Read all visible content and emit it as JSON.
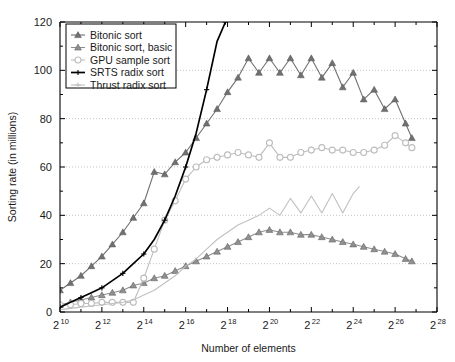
{
  "chart_data": {
    "type": "line",
    "title": "",
    "xlabel": "Number of elements",
    "ylabel": "Sorting rate (in millions)",
    "xlim": [
      10,
      28
    ],
    "ylim": [
      0,
      120
    ],
    "x_tick_labels": [
      "2^10",
      "2^12",
      "2^14",
      "2^16",
      "2^18",
      "2^20",
      "2^22",
      "2^24",
      "2^26",
      "2^28"
    ],
    "x_tick_base": "2",
    "x_tick_exponents": [
      "10",
      "12",
      "14",
      "16",
      "18",
      "20",
      "22",
      "24",
      "26",
      "28"
    ],
    "y_tick_labels": [
      "0",
      "20",
      "40",
      "60",
      "80",
      "100",
      "120"
    ],
    "y_ticks": [
      0,
      20,
      40,
      60,
      80,
      100,
      120
    ],
    "grid": "horizontal-dotted",
    "legend_position": "top-left",
    "series": [
      {
        "name": "Bitonic sort",
        "color": "#707070",
        "marker": "triangle-filled",
        "x": [
          10,
          10.5,
          11,
          11.5,
          12,
          12.5,
          13,
          13.5,
          14,
          14.5,
          15,
          15.5,
          16,
          16.5,
          17,
          17.5,
          18,
          18.5,
          19,
          19.5,
          20,
          20.5,
          21,
          21.5,
          22,
          22.5,
          23,
          23.5,
          24,
          24.5,
          25,
          25.5,
          26,
          26.5,
          26.8
        ],
        "y": [
          9,
          12,
          15,
          19,
          23,
          28,
          33,
          39,
          45,
          58,
          57,
          62,
          66,
          72,
          78,
          84,
          91,
          97,
          105,
          99,
          105,
          99,
          105,
          98,
          105,
          97,
          103,
          93,
          99,
          88,
          92,
          84,
          88,
          78,
          72
        ]
      },
      {
        "name": "Bitonic sort, basic",
        "color": "#909090",
        "marker": "triangle-filled",
        "x": [
          10,
          10.5,
          11,
          11.5,
          12,
          12.5,
          13,
          13.5,
          14,
          14.5,
          15,
          15.5,
          16,
          16.5,
          17,
          17.5,
          18,
          18.5,
          19,
          19.5,
          20,
          20.5,
          21,
          21.5,
          22,
          22.5,
          23,
          23.5,
          24,
          24.5,
          25,
          25.5,
          26,
          26.5,
          26.8
        ],
        "y": [
          3,
          4,
          5,
          6,
          7,
          8,
          9,
          11,
          12,
          14,
          15,
          17,
          19,
          21,
          23,
          25,
          27,
          29,
          31,
          33,
          34,
          33,
          33,
          32,
          32,
          31,
          30,
          29,
          28,
          27,
          26,
          25,
          24,
          22,
          21
        ]
      },
      {
        "name": "GPU sample sort",
        "color": "#bdbdbd",
        "marker": "circle-open",
        "x": [
          10,
          10.5,
          11,
          11.5,
          12,
          12.5,
          13,
          13.5,
          14,
          14.5,
          15,
          15.5,
          16,
          16.5,
          17,
          17.5,
          18,
          18.5,
          19,
          19.5,
          20,
          20.5,
          21,
          21.5,
          22,
          22.5,
          23,
          23.5,
          24,
          24.5,
          25,
          25.5,
          26,
          26.5,
          26.8
        ],
        "y": [
          3,
          3,
          3.5,
          3.5,
          4,
          4,
          4,
          4,
          14,
          26,
          38,
          46,
          55,
          60,
          63,
          64,
          65,
          66,
          65,
          64,
          70,
          64,
          64,
          66,
          67,
          68,
          67,
          67,
          66,
          66,
          67,
          69,
          73,
          70,
          68
        ]
      },
      {
        "name": "SRTS radix sort",
        "color": "#000000",
        "marker": "plus-line",
        "x": [
          10,
          10.5,
          11,
          11.5,
          12,
          12.5,
          13,
          13.5,
          14,
          14.5,
          15,
          15.5,
          16,
          16.5,
          17,
          17.5,
          17.9
        ],
        "y": [
          2,
          4,
          6,
          8,
          10,
          13,
          16,
          20,
          24,
          30,
          38,
          48,
          60,
          74,
          92,
          112,
          120
        ]
      },
      {
        "name": "Thrust radix sort",
        "color": "#c0c0c0",
        "marker": "plus-line",
        "x": [
          10,
          10.5,
          11,
          11.5,
          12,
          12.5,
          13,
          13.5,
          14,
          14.5,
          15,
          15.5,
          16,
          16.5,
          17,
          17.5,
          18,
          18.5,
          19,
          19.5,
          20,
          20.5,
          21,
          21.5,
          22,
          22.5,
          23,
          23.5,
          24,
          24.3
        ],
        "y": [
          1,
          1.5,
          2,
          2.5,
          3,
          3.5,
          4,
          5,
          7,
          9,
          12,
          15,
          19,
          22,
          26,
          30,
          33,
          36,
          38,
          40,
          43,
          40,
          47,
          41,
          48,
          41,
          49,
          41,
          49,
          52
        ]
      }
    ],
    "legend": [
      {
        "label": "Bitonic sort",
        "color": "#707070",
        "marker": "triangle-filled"
      },
      {
        "label": "Bitonic sort, basic",
        "color": "#909090",
        "marker": "triangle-filled"
      },
      {
        "label": "GPU sample sort",
        "color": "#bdbdbd",
        "marker": "circle-open"
      },
      {
        "label": "SRTS radix sort",
        "color": "#000000",
        "marker": "plus-line"
      },
      {
        "label": "Thrust radix sort",
        "color": "#c0c0c0",
        "marker": "plus-line"
      }
    ]
  }
}
